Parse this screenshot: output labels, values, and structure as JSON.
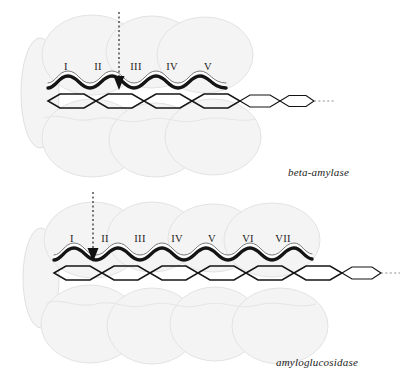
{
  "figure": {
    "kind": "enzyme-subsite-binding-diagram",
    "background_color": "#ffffff",
    "lobe_fill": "#f4f4f4",
    "lobe_stroke": "#e2e2e2",
    "chain_stroke": "#141414",
    "arrow_color": "#111111"
  },
  "panels": [
    {
      "id": "beta-amylase",
      "caption": "beta-amylase",
      "caption_position": {
        "x": 288,
        "y": 172
      },
      "subsites": [
        {
          "label": "I",
          "x": 66
        },
        {
          "label": "II",
          "x": 98
        },
        {
          "label": "III",
          "x": 136
        },
        {
          "label": "IV",
          "x": 172
        },
        {
          "label": "V",
          "x": 208
        }
      ],
      "subsite_count": 5,
      "cleavage_arrow": {
        "x": 119,
        "y_top": 12,
        "y_bottom": 86,
        "style": "dotted-with-solid-head"
      },
      "chain": {
        "ring_count": 8,
        "x_start": 48,
        "x_end": 296,
        "tail_x_end": 317,
        "y_center": 101
      },
      "ribbon": {
        "x_start": 48,
        "x_end": 226,
        "y_center": 86,
        "wave_count": 5
      }
    },
    {
      "id": "amyloglucosidase",
      "caption": "amyloglucosidase",
      "caption_position": {
        "x": 276,
        "y": 362
      },
      "subsites": [
        {
          "label": "I",
          "x": 72
        },
        {
          "label": "II",
          "x": 105
        },
        {
          "label": "III",
          "x": 140
        },
        {
          "label": "IV",
          "x": 177
        },
        {
          "label": "V",
          "x": 212
        },
        {
          "label": "VI",
          "x": 248
        },
        {
          "label": "VII",
          "x": 283
        }
      ],
      "subsite_count": 7,
      "cleavage_arrow": {
        "x": 93,
        "y_top": 192,
        "y_bottom": 264,
        "style": "dotted-with-solid-head"
      },
      "chain": {
        "ring_count": 10,
        "x_start": 54,
        "x_end": 372,
        "tail_x_end": 392,
        "y_center": 273
      },
      "ribbon": {
        "x_start": 54,
        "x_end": 302,
        "y_center": 258,
        "wave_count": 7
      }
    }
  ]
}
